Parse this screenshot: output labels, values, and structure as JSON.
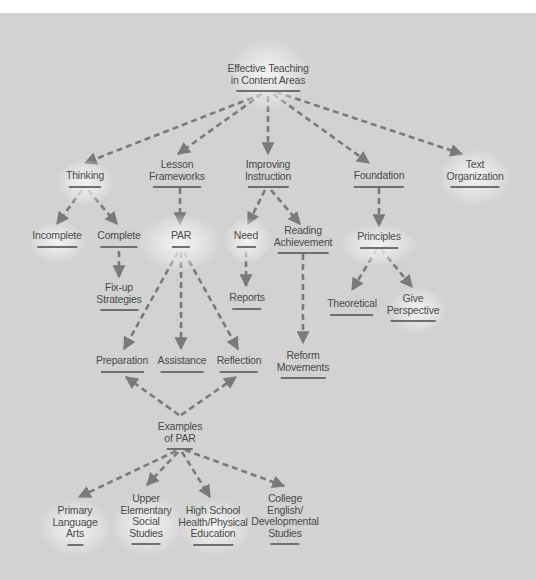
{
  "diagram": {
    "title": "Effective Teaching in Content Areas",
    "colors": {
      "background": "#d2d2d2",
      "connector": "#7a7a7a",
      "text": "#4a4a4a",
      "underline": "#6f6f6f"
    },
    "nodes": {
      "root": {
        "lines": [
          "Effective Teaching",
          "in Content Areas"
        ]
      },
      "thinking": {
        "lines": [
          "Thinking"
        ]
      },
      "lesson": {
        "lines": [
          "Lesson",
          "Frameworks"
        ]
      },
      "improving": {
        "lines": [
          "Improving",
          "Instruction"
        ]
      },
      "foundation": {
        "lines": [
          "Foundation"
        ]
      },
      "textorg": {
        "lines": [
          "Text",
          "Organization"
        ]
      },
      "incomplete": {
        "lines": [
          "Incomplete"
        ]
      },
      "complete": {
        "lines": [
          "Complete"
        ]
      },
      "par": {
        "lines": [
          "PAR"
        ]
      },
      "need": {
        "lines": [
          "Need"
        ]
      },
      "reading": {
        "lines": [
          "Reading",
          "Achievement"
        ]
      },
      "principles": {
        "lines": [
          "Principles"
        ]
      },
      "fixup": {
        "lines": [
          "Fix-up",
          "Strategies"
        ]
      },
      "reports": {
        "lines": [
          "Reports"
        ]
      },
      "theoretical": {
        "lines": [
          "Theoretical"
        ]
      },
      "give": {
        "lines": [
          "Give",
          "Perspective"
        ]
      },
      "preparation": {
        "lines": [
          "Preparation"
        ]
      },
      "assistance": {
        "lines": [
          "Assistance"
        ]
      },
      "reflection": {
        "lines": [
          "Reflection"
        ]
      },
      "reform": {
        "lines": [
          "Reform",
          "Movements"
        ]
      },
      "examples": {
        "lines": [
          "Examples",
          "of PAR"
        ]
      },
      "primary": {
        "lines": [
          "Primary",
          "Language",
          "Arts"
        ]
      },
      "upper": {
        "lines": [
          "Upper",
          "Elementary",
          "Social",
          "Studies"
        ]
      },
      "highschool": {
        "lines": [
          "High School",
          "Health/Physical",
          "Education"
        ]
      },
      "college": {
        "lines": [
          "College",
          "English/",
          "Developmental",
          "Studies"
        ]
      }
    },
    "edges": [
      [
        "root",
        "thinking"
      ],
      [
        "root",
        "lesson"
      ],
      [
        "root",
        "improving"
      ],
      [
        "root",
        "foundation"
      ],
      [
        "root",
        "textorg"
      ],
      [
        "thinking",
        "incomplete"
      ],
      [
        "thinking",
        "complete"
      ],
      [
        "complete",
        "fixup"
      ],
      [
        "lesson",
        "par"
      ],
      [
        "par",
        "preparation"
      ],
      [
        "par",
        "assistance"
      ],
      [
        "par",
        "reflection"
      ],
      [
        "improving",
        "need"
      ],
      [
        "improving",
        "reading"
      ],
      [
        "need",
        "reports"
      ],
      [
        "reading",
        "reform"
      ],
      [
        "foundation",
        "principles"
      ],
      [
        "principles",
        "theoretical"
      ],
      [
        "principles",
        "give"
      ],
      [
        "examples",
        "preparation"
      ],
      [
        "examples",
        "reflection"
      ],
      [
        "examples",
        "primary"
      ],
      [
        "examples",
        "upper"
      ],
      [
        "examples",
        "highschool"
      ],
      [
        "examples",
        "college"
      ]
    ]
  }
}
